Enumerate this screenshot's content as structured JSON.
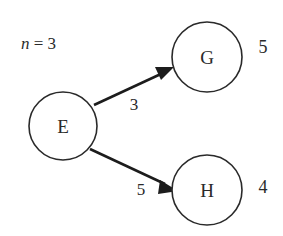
{
  "diagram": {
    "background_color": "#ffffff",
    "stroke_color": "#2a2a2a",
    "edge_color": "#1c1c1c",
    "annotation": {
      "variable": "n",
      "equals": " = ",
      "value": "3",
      "full_text": "n = 3"
    },
    "nodes": [
      {
        "id": "E",
        "label": "E",
        "cx": 63,
        "cy": 126,
        "r": 34,
        "side_value": ""
      },
      {
        "id": "G",
        "label": "G",
        "cx": 207,
        "cy": 57,
        "r": 35,
        "side_value": "5"
      },
      {
        "id": "H",
        "label": "H",
        "cx": 207,
        "cy": 190,
        "r": 35,
        "side_value": "4"
      }
    ],
    "edges": [
      {
        "from": "E",
        "to": "G",
        "weight": "3",
        "label_x": 134,
        "label_y": 104
      },
      {
        "from": "E",
        "to": "H",
        "weight": "5",
        "label_x": 141,
        "label_y": 189
      }
    ],
    "side_values": [
      {
        "node": "G",
        "value": "5",
        "x": 263,
        "y": 47
      },
      {
        "node": "H",
        "value": "4",
        "x": 263,
        "y": 187
      }
    ]
  }
}
